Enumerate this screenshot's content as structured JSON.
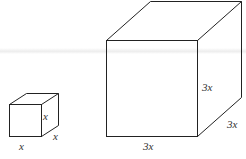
{
  "figure": {
    "small_cube": {
      "labels": {
        "front_bottom": "x",
        "right_side": "x",
        "depth": "x"
      }
    },
    "large_cube": {
      "labels": {
        "front_bottom": "3x",
        "right_side": "3x",
        "depth": "3x"
      }
    }
  }
}
